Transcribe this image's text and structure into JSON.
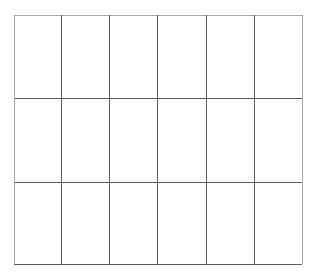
{
  "grid": {
    "rows": 3,
    "columns": 6,
    "line_color": "#5a5a5a",
    "border_color": "#a8a8a8",
    "background": "#ffffff",
    "col_lines_x": [
      0,
      47,
      95,
      143,
      192,
      240,
      288
    ],
    "row_lines_y": [
      0,
      83,
      167,
      249
    ]
  }
}
